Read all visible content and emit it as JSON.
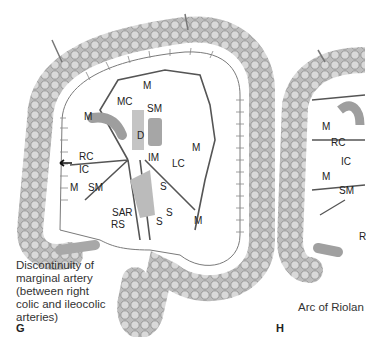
{
  "figure": {
    "panels": [
      {
        "letter": "G",
        "caption_lines": [
          "Discontinuity of",
          "marginal artery",
          "(between right",
          "colic and ileocolic",
          "arteries)"
        ],
        "labels": {
          "m_top": "M",
          "mc": "MC",
          "sm_top": "SM",
          "m_left": "M",
          "d": "D",
          "m_right": "M",
          "rc": "RC",
          "ic": "IC",
          "im": "IM",
          "lc": "LC",
          "m_low": "M",
          "sm_low": "SM",
          "s1": "S",
          "sar": "SAR",
          "s2": "S",
          "rs": "RS",
          "s3": "S",
          "m_br": "M"
        }
      },
      {
        "letter": "H",
        "caption_lines": [
          "Arc of Riolan"
        ],
        "labels": {
          "m1": "M",
          "rc": "RC",
          "ic": "IC",
          "m2": "M",
          "sm": "SM",
          "r_partial": "R"
        }
      }
    ]
  }
}
